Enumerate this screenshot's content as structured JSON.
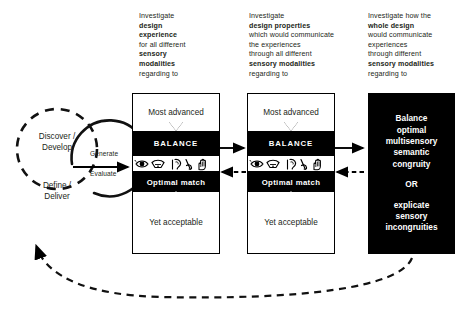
{
  "diagram": {
    "accent_dark": "#000000",
    "accent_light": "#ffffff"
  },
  "double_diamond": {
    "discover": {
      "line1": "Discover /",
      "line2": "Develop"
    },
    "define": {
      "line1": "Define /",
      "line2": "Deliver"
    },
    "generate_label": "Generate",
    "evaluate_label": "Evaluate"
  },
  "captions": [
    {
      "id": "caption-1",
      "lines": [
        {
          "text": "Investigate",
          "bold": false
        },
        {
          "text": "design",
          "bold": true
        },
        {
          "text": "experience",
          "bold": true
        },
        {
          "text": "for all different",
          "bold": false
        },
        {
          "text": "sensory",
          "bold": true
        },
        {
          "text": "modalities",
          "bold": true
        },
        {
          "text": "regarding to",
          "bold": false
        }
      ]
    },
    {
      "id": "caption-2",
      "lines": [
        {
          "text": "Investigate",
          "bold": false
        },
        {
          "text": "design properties",
          "bold": true
        },
        {
          "text": "which would communicate",
          "bold": false
        },
        {
          "text": "the experiences",
          "bold": false
        },
        {
          "text": "through all different",
          "bold": false
        },
        {
          "text": "sensory modalities",
          "bold": true
        },
        {
          "text": "regarding to",
          "bold": false
        }
      ]
    },
    {
      "id": "caption-3",
      "lines": [
        {
          "text": "Investigate how the",
          "bold": false
        },
        {
          "text": "whole design",
          "bold": true
        },
        {
          "text": "would communicate",
          "bold": false
        },
        {
          "text": "experiences",
          "bold": false
        },
        {
          "text": "through different",
          "bold": false
        },
        {
          "text": "sensory modalities",
          "bold": true
        },
        {
          "text": "regarding to",
          "bold": false
        }
      ]
    }
  ],
  "process_boxes": [
    {
      "id": "process-box-1",
      "top": "Most advanced",
      "balance": "BALANCE",
      "optimal": "Optimal match",
      "bottom": "Yet acceptable",
      "senses": [
        "eye-icon",
        "nose-icon",
        "ear-icon",
        "tongue-icon",
        "hand-icon"
      ]
    },
    {
      "id": "process-box-2",
      "top": "Most advanced",
      "balance": "BALANCE",
      "optimal": "Optimal match",
      "bottom": "Yet acceptable",
      "senses": [
        "eye-icon",
        "nose-icon",
        "ear-icon",
        "tongue-icon",
        "hand-icon"
      ]
    }
  ],
  "outcome": {
    "id": "outcome-box",
    "lines_a": [
      "Balance",
      "optimal",
      "multisensory",
      "semantic",
      "congruity"
    ],
    "connector": "OR",
    "lines_b": [
      "explicate",
      "sensory",
      "incongruities"
    ]
  }
}
